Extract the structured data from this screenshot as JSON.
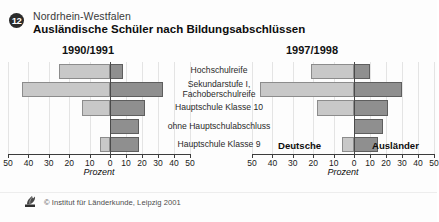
{
  "header": {
    "badge_number": "12",
    "region": "Nordrhein-Westfalen",
    "title": "Ausländische Schüler nach Bildungsabschlüssen"
  },
  "panels": {
    "left_heading": "1990/1991",
    "right_heading": "1997/1998"
  },
  "series_labels": {
    "deutsche": "Deutsche",
    "auslaender": "Ausländer"
  },
  "axis": {
    "title": "Prozent",
    "ticks": [
      "50",
      "40",
      "30",
      "20",
      "10",
      "0",
      "10",
      "20",
      "30",
      "40",
      "50"
    ]
  },
  "categories": [
    "Hochschulreife",
    "Sekundarstufe I,|Fachoberschulreife",
    "Hauptschule Klasse 10",
    "ohne Hauptschulabschluss",
    "Hauptschule Klasse 9"
  ],
  "colors": {
    "deutsche_fill": "#c8c8c8",
    "deutsche_stroke": "#8c8c8c",
    "auslaender_fill": "#8f8f8f",
    "auslaender_stroke": "#5e5e5e",
    "zero_line": "#4a4a4a",
    "grid": "#e4e4e4"
  },
  "footer": {
    "copyright": "© Institut für Länderkunde, Leipzig 2001"
  },
  "chart_data": {
    "type": "bar",
    "title": "Ausländische Schüler nach Bildungsabschlüssen",
    "subtitle": "Nordrhein-Westfalen",
    "orientation": "horizontal-diverging",
    "xlabel": "Prozent",
    "ylabel": "",
    "xlim": [
      -50,
      50
    ],
    "xticks": [
      -50,
      -40,
      -30,
      -20,
      -10,
      0,
      10,
      20,
      30,
      40,
      50
    ],
    "xticklabels": [
      "50",
      "40",
      "30",
      "20",
      "10",
      "0",
      "10",
      "20",
      "30",
      "40",
      "50"
    ],
    "grid": true,
    "legend_position": "inside-bottom",
    "categories": [
      "Hochschulreife",
      "Sekundarstufe I, Fachoberschulreife",
      "Hauptschule Klasse 10",
      "ohne Hauptschulabschluss",
      "Hauptschule Klasse 9"
    ],
    "panels": [
      {
        "name": "1990/1991",
        "series": [
          {
            "name": "Deutsche",
            "side": "left",
            "values": [
              25,
              43,
              14,
              0,
              5
            ]
          },
          {
            "name": "Ausländer",
            "side": "right",
            "values": [
              8,
              33,
              22,
              18,
              18
            ]
          }
        ]
      },
      {
        "name": "1997/1998",
        "series": [
          {
            "name": "Deutsche",
            "side": "left",
            "values": [
              21,
              46,
              18,
              0,
              6
            ]
          },
          {
            "name": "Ausländer",
            "side": "right",
            "values": [
              10,
              30,
              21,
              18,
              15
            ]
          }
        ]
      }
    ]
  }
}
